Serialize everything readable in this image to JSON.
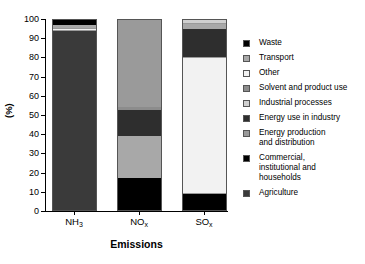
{
  "chart_data": {
    "type": "bar",
    "stacked": true,
    "title": "",
    "xlabel": "Emissions",
    "ylabel": "(%)",
    "ylim": [
      0,
      100
    ],
    "yticks": [
      0,
      10,
      20,
      30,
      40,
      50,
      60,
      70,
      80,
      90,
      100
    ],
    "ytick_labels": [
      "0",
      "10",
      "20",
      "30",
      "40",
      "50",
      "60",
      "70",
      "80",
      "90",
      "100"
    ],
    "grid": false,
    "legend_position": "right",
    "categories": [
      "NH3",
      "NOx",
      "SOx"
    ],
    "category_labels": [
      {
        "base": "NH",
        "sub": "3"
      },
      {
        "base": "NO",
        "sub": "x"
      },
      {
        "base": "SO",
        "sub": "x"
      }
    ],
    "series": [
      {
        "name": "Agriculture",
        "color": "#3a3a3a",
        "values": [
          93.5,
          0,
          0
        ]
      },
      {
        "name": "Commercial, institutional and households",
        "color": "#000000",
        "values": [
          0,
          17,
          9
        ]
      },
      {
        "name": "Energy production and distribution",
        "color": "#9a9a9a",
        "values": [
          0,
          46,
          0
        ]
      },
      {
        "name": "Energy use in industry",
        "color": "#2e2e2e",
        "values": [
          0,
          13.5,
          15
        ]
      },
      {
        "name": "Industrial processes",
        "color": "#d0d0d0",
        "values": [
          0,
          0,
          2.5
        ]
      },
      {
        "name": "Solvent and product use",
        "color": "#8c8c8c",
        "values": [
          0,
          1.5,
          0
        ]
      },
      {
        "name": "Other",
        "color": "#f2f2f2",
        "values": [
          2,
          0,
          71
        ]
      },
      {
        "name": "Transport",
        "color": "#a8a8a8",
        "values": [
          1.5,
          22,
          2.5
        ]
      },
      {
        "name": "Waste",
        "color": "#000000",
        "values": [
          3,
          0,
          0
        ]
      }
    ],
    "stack_order": {
      "NH3": [
        {
          "name": "Agriculture",
          "color": "#3a3a3a",
          "from": 0,
          "to": 93.5
        },
        {
          "name": "Other",
          "color": "#f2f2f2",
          "from": 93.5,
          "to": 95.5
        },
        {
          "name": "Transport",
          "color": "#a8a8a8",
          "from": 95.5,
          "to": 97.0
        },
        {
          "name": "Waste",
          "color": "#000000",
          "from": 97.0,
          "to": 100
        }
      ],
      "NOx": [
        {
          "name": "Commercial, institutional and households",
          "color": "#000000",
          "from": 0,
          "to": 17
        },
        {
          "name": "Transport",
          "color": "#a8a8a8",
          "from": 17,
          "to": 39
        },
        {
          "name": "Energy use in industry",
          "color": "#2e2e2e",
          "from": 39,
          "to": 52.5
        },
        {
          "name": "Solvent and product use",
          "color": "#8c8c8c",
          "from": 52.5,
          "to": 54
        },
        {
          "name": "Energy production and distribution",
          "color": "#9a9a9a",
          "from": 54,
          "to": 100
        }
      ],
      "SOx": [
        {
          "name": "Commercial, institutional and households",
          "color": "#000000",
          "from": 0,
          "to": 9
        },
        {
          "name": "Other",
          "color": "#f2f2f2",
          "from": 9,
          "to": 80
        },
        {
          "name": "Energy use in industry",
          "color": "#2e2e2e",
          "from": 80,
          "to": 95
        },
        {
          "name": "Transport",
          "color": "#a8a8a8",
          "from": 95,
          "to": 97.5
        },
        {
          "name": "Industrial processes",
          "color": "#d0d0d0",
          "from": 97.5,
          "to": 100
        }
      ]
    },
    "legend": [
      {
        "label": "Waste",
        "color": "#000000"
      },
      {
        "label": "Transport",
        "color": "#a8a8a8"
      },
      {
        "label": "Other",
        "color": "#f2f2f2"
      },
      {
        "label": "Solvent and product use",
        "color": "#8c8c8c"
      },
      {
        "label": "Industrial processes",
        "color": "#d0d0d0"
      },
      {
        "label": "Energy use in industry",
        "color": "#2e2e2e"
      },
      {
        "label": "Energy production\nand distribution",
        "color": "#9a9a9a"
      },
      {
        "label": "Commercial,\ninstitutional and\nhouseholds",
        "color": "#000000"
      },
      {
        "label": "Agriculture",
        "color": "#3a3a3a"
      }
    ]
  }
}
